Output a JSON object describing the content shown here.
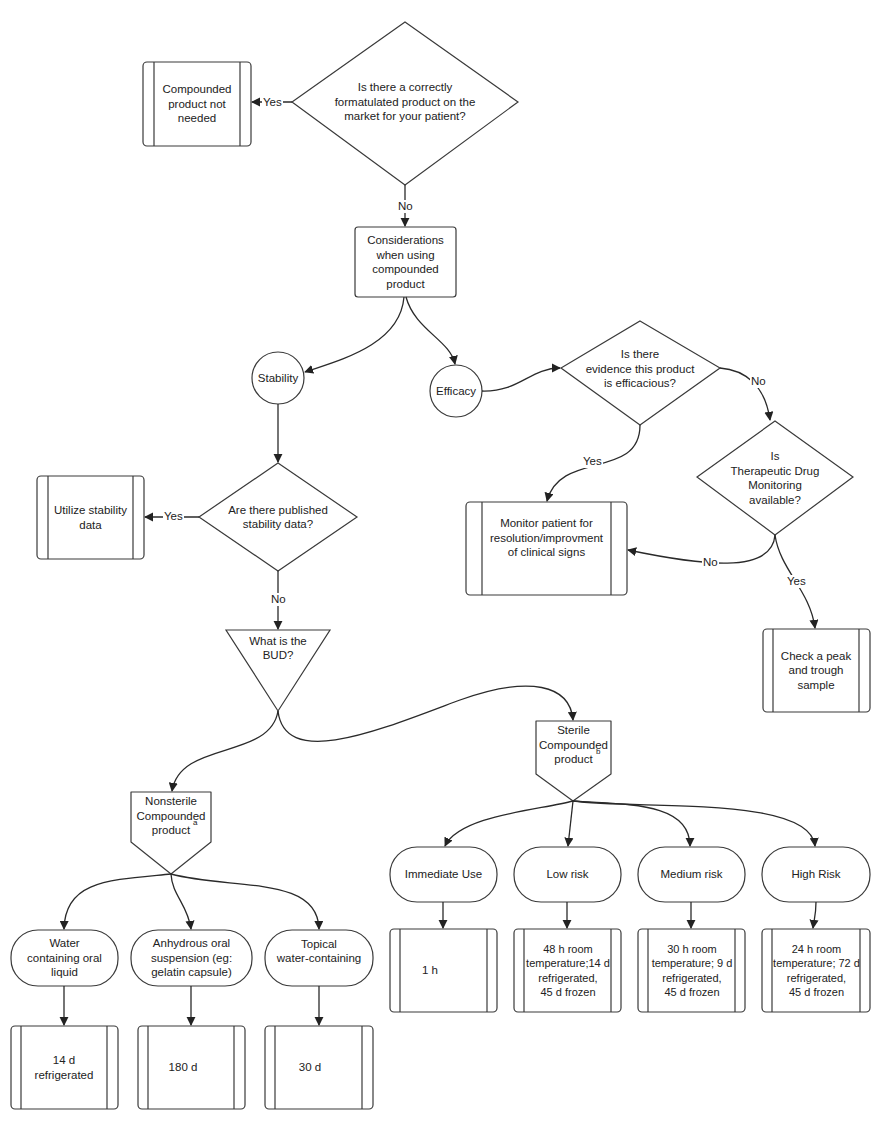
{
  "diagram": {
    "type": "clinical decision flowchart",
    "nodes": {
      "q_market": {
        "text": "Is there a correctly\nformatulated product on the\nmarket for your patient?",
        "shape": "diamond"
      },
      "not_needed": {
        "text": "Compounded\nproduct not\nneeded",
        "shape": "predefined-process"
      },
      "considerations": {
        "text": "Considerations\nwhen using\ncompounded\nproduct",
        "shape": "rectangle"
      },
      "stability": {
        "text": "Stability",
        "shape": "circle"
      },
      "efficacy": {
        "text": "Efficacy",
        "shape": "circle"
      },
      "q_efficacious": {
        "text": "Is there\nevidence this product\nis efficacious?",
        "shape": "diamond"
      },
      "q_tdm": {
        "text": "Is\nTherapeutic Drug\nMonitoring\navailable?",
        "shape": "diamond"
      },
      "monitor": {
        "text": "Monitor patient for\nresolution/improvment\nof clinical signs",
        "shape": "predefined-process"
      },
      "peak_trough": {
        "text": "Check a peak\nand trough\nsample",
        "shape": "predefined-process"
      },
      "q_stability": {
        "text": "Are there published\nstability data?",
        "shape": "diamond"
      },
      "utilize": {
        "text": "Utilize stability\ndata",
        "shape": "predefined-process"
      },
      "bud": {
        "text": "What is the\nBUD?",
        "shape": "inverted-triangle"
      },
      "sterile": {
        "text": "Sterile\nCompounded\nproduct",
        "sup": "b",
        "shape": "offpage-connector"
      },
      "nonsterile": {
        "text": "Nonsterile\nCompounded\nproduct",
        "sup": "a",
        "shape": "offpage-connector"
      },
      "immediate": {
        "text": "Immediate Use",
        "shape": "terminator"
      },
      "low": {
        "text": "Low risk",
        "shape": "terminator"
      },
      "medium": {
        "text": "Medium risk",
        "shape": "terminator"
      },
      "high": {
        "text": "High Risk",
        "shape": "terminator"
      },
      "bud_immediate": {
        "text": "1 h",
        "shape": "predefined-process"
      },
      "bud_low": {
        "text": "48 h room\ntemperature;14 d\nrefrigerated,\n45 d frozen",
        "shape": "predefined-process"
      },
      "bud_medium": {
        "text": "30 h room\ntemperature; 9 d\nrefrigerated,\n45 d frozen",
        "shape": "predefined-process"
      },
      "bud_high": {
        "text": "24 h room\ntemperature; 72 d\nrefrigerated,\n45 d frozen",
        "shape": "predefined-process"
      },
      "water_oral": {
        "text": "Water\ncontaining oral\nliquid",
        "shape": "terminator"
      },
      "anhydrous": {
        "text": "Anhydrous oral\nsuspension (eg:\ngelatin capsule)",
        "shape": "terminator"
      },
      "topical": {
        "text": "Topical\nwater-containing",
        "shape": "terminator"
      },
      "bud_water": {
        "text": "14 d\nrefrigerated",
        "shape": "predefined-process"
      },
      "bud_anhydrous": {
        "text": "180 d",
        "shape": "predefined-process"
      },
      "bud_topical": {
        "text": "30 d",
        "shape": "predefined-process"
      }
    },
    "edge_labels": {
      "market_yes": "Yes",
      "market_no": "No",
      "efficacious_yes": "Yes",
      "efficacious_no": "No",
      "tdm_no": "No",
      "tdm_yes": "Yes",
      "stability_yes": "Yes",
      "stability_no": "No"
    },
    "edges": [
      {
        "from": "q_market",
        "to": "not_needed",
        "label": "Yes"
      },
      {
        "from": "q_market",
        "to": "considerations",
        "label": "No"
      },
      {
        "from": "considerations",
        "to": "stability"
      },
      {
        "from": "considerations",
        "to": "efficacy"
      },
      {
        "from": "efficacy",
        "to": "q_efficacious"
      },
      {
        "from": "q_efficacious",
        "to": "monitor",
        "label": "Yes"
      },
      {
        "from": "q_efficacious",
        "to": "q_tdm",
        "label": "No"
      },
      {
        "from": "q_tdm",
        "to": "monitor",
        "label": "No"
      },
      {
        "from": "q_tdm",
        "to": "peak_trough",
        "label": "Yes"
      },
      {
        "from": "stability",
        "to": "q_stability"
      },
      {
        "from": "q_stability",
        "to": "utilize",
        "label": "Yes"
      },
      {
        "from": "q_stability",
        "to": "bud",
        "label": "No"
      },
      {
        "from": "bud",
        "to": "nonsterile"
      },
      {
        "from": "bud",
        "to": "sterile"
      },
      {
        "from": "sterile",
        "to": "immediate"
      },
      {
        "from": "sterile",
        "to": "low"
      },
      {
        "from": "sterile",
        "to": "medium"
      },
      {
        "from": "sterile",
        "to": "high"
      },
      {
        "from": "immediate",
        "to": "bud_immediate"
      },
      {
        "from": "low",
        "to": "bud_low"
      },
      {
        "from": "medium",
        "to": "bud_medium"
      },
      {
        "from": "high",
        "to": "bud_high"
      },
      {
        "from": "nonsterile",
        "to": "water_oral"
      },
      {
        "from": "nonsterile",
        "to": "anhydrous"
      },
      {
        "from": "nonsterile",
        "to": "topical"
      },
      {
        "from": "water_oral",
        "to": "bud_water"
      },
      {
        "from": "anhydrous",
        "to": "bud_anhydrous"
      },
      {
        "from": "topical",
        "to": "bud_topical"
      }
    ]
  }
}
